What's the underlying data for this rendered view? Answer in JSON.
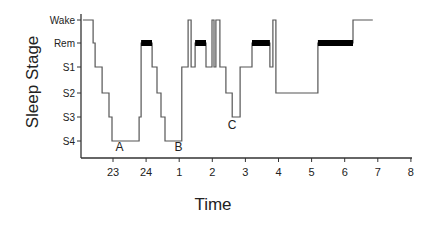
{
  "chart_data": {
    "type": "line",
    "subtype": "hypnogram-step",
    "title": "",
    "xlabel": "Time",
    "ylabel": "Sleep Stage",
    "x_ticks": [
      23,
      24,
      1,
      2,
      3,
      4,
      5,
      6,
      7,
      8
    ],
    "x_tick_hours": [
      23,
      24,
      25,
      26,
      27,
      28,
      29,
      30,
      31,
      32
    ],
    "xlim": [
      22.0,
      32.0
    ],
    "y_categories": [
      "Wake",
      "Rem",
      "S1",
      "S2",
      "S3",
      "S4"
    ],
    "grid": false,
    "legend": null,
    "rem_marker": "thick black bar on REM segments",
    "segments": [
      {
        "stage": "Wake",
        "start": 22.09,
        "end": 22.4
      },
      {
        "stage": "Rem",
        "start": 22.4,
        "end": 22.46,
        "thin": true
      },
      {
        "stage": "S1",
        "start": 22.46,
        "end": 22.67
      },
      {
        "stage": "S2",
        "start": 22.67,
        "end": 22.88
      },
      {
        "stage": "S3",
        "start": 22.88,
        "end": 22.97
      },
      {
        "stage": "S4",
        "start": 22.97,
        "end": 23.79
      },
      {
        "stage": "S3",
        "start": 23.79,
        "end": 23.85
      },
      {
        "stage": "Rem",
        "start": 23.85,
        "end": 24.18
      },
      {
        "stage": "S1",
        "start": 24.18,
        "end": 24.33
      },
      {
        "stage": "S2",
        "start": 24.33,
        "end": 24.45
      },
      {
        "stage": "S3",
        "start": 24.45,
        "end": 24.57
      },
      {
        "stage": "S4",
        "start": 24.57,
        "end": 25.08
      },
      {
        "stage": "S1",
        "start": 25.08,
        "end": 25.27
      },
      {
        "stage": "Wake",
        "start": 25.27,
        "end": 25.36
      },
      {
        "stage": "S1",
        "start": 25.36,
        "end": 25.48
      },
      {
        "stage": "Rem",
        "start": 25.48,
        "end": 25.81
      },
      {
        "stage": "S1",
        "start": 25.81,
        "end": 25.99
      },
      {
        "stage": "Wake",
        "start": 25.99,
        "end": 26.05
      },
      {
        "stage": "S1",
        "start": 26.05,
        "end": 26.11
      },
      {
        "stage": "Wake",
        "start": 26.11,
        "end": 26.23
      },
      {
        "stage": "S1",
        "start": 26.23,
        "end": 26.41
      },
      {
        "stage": "S2",
        "start": 26.41,
        "end": 26.6
      },
      {
        "stage": "S3",
        "start": 26.6,
        "end": 26.84
      },
      {
        "stage": "S1",
        "start": 26.84,
        "end": 27.2
      },
      {
        "stage": "Rem",
        "start": 27.2,
        "end": 27.74
      },
      {
        "stage": "S1",
        "start": 27.74,
        "end": 27.83
      },
      {
        "stage": "Wake",
        "start": 27.83,
        "end": 27.92
      },
      {
        "stage": "S2",
        "start": 27.92,
        "end": 29.19
      },
      {
        "stage": "Rem",
        "start": 29.19,
        "end": 30.25
      },
      {
        "stage": "Wake",
        "start": 30.25,
        "end": 30.85
      }
    ],
    "annotations": [
      {
        "label": "A",
        "time": 23.2,
        "stage_pos": 5.4
      },
      {
        "label": "B",
        "time": 24.98,
        "stage_pos": 5.4
      },
      {
        "label": "C",
        "time": 26.6,
        "stage_pos": 4.5
      }
    ]
  },
  "colors": {
    "line": "#555555",
    "rem_bar": "#000000",
    "axis": "#333333",
    "text": "#222222",
    "background": "#ffffff"
  }
}
